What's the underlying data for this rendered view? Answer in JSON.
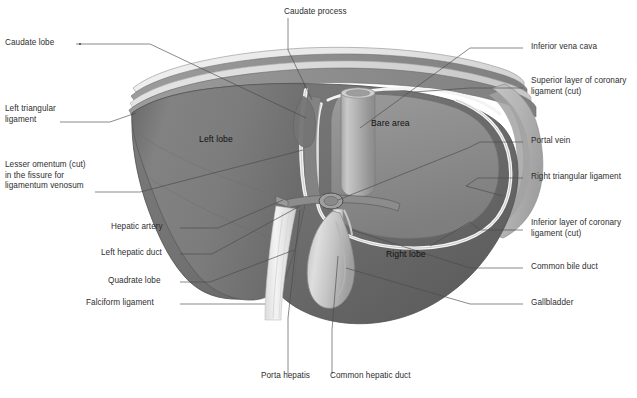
{
  "figure": {
    "background_color": "#ffffff",
    "label_color": "#2e2e2e",
    "leader_color": "#4a4a4a",
    "palette": {
      "liver_left_lobe": "#7d7d7d",
      "liver_right_lobe": "#6f6f6f",
      "bare_area": "#8a8a8a",
      "liver_dark_edge": "#5a5a5a",
      "diaphragm_light": "#d8d8d8",
      "diaphragm_mid": "#b4b4b4",
      "diaphragm_dark": "#8f8f8f",
      "peritoneum_highlight": "#f2f2f2",
      "vessel_gray": "#9a9a9a",
      "gallbladder": "#c9c9c9",
      "falciform": "#e6e6e6"
    }
  },
  "labels_left": [
    {
      "id": "caudate-lobe",
      "text": "Caudate lobe"
    },
    {
      "id": "left-triangular-ligament",
      "text": "Left triangular\nligament"
    },
    {
      "id": "lesser-omentum",
      "text": "Lesser omentum (cut)\nin the fissure for\nligamentum venosum"
    },
    {
      "id": "hepatic-artery",
      "text": "Hepatic artery"
    },
    {
      "id": "left-hepatic-duct",
      "text": "Left hepatic duct"
    },
    {
      "id": "quadrate-lobe",
      "text": "Quadrate lobe"
    },
    {
      "id": "falciform-ligament",
      "text": "Falciform ligament"
    }
  ],
  "labels_right": [
    {
      "id": "inferior-vena-cava",
      "text": "Inferior vena cava"
    },
    {
      "id": "superior-coronary-ligament",
      "text": "Superior layer of coronary\nligament (cut)"
    },
    {
      "id": "portal-vein",
      "text": "Portal vein"
    },
    {
      "id": "right-triangular-ligament",
      "text": "Right triangular ligament"
    },
    {
      "id": "inferior-coronary-ligament",
      "text": "Inferior layer of coronary\nligament (cut)"
    },
    {
      "id": "common-bile-duct",
      "text": "Common bile duct"
    },
    {
      "id": "gallbladder",
      "text": "Gallbladder"
    }
  ],
  "labels_top": [
    {
      "id": "caudate-process",
      "text": "Caudate process"
    }
  ],
  "labels_bottom": [
    {
      "id": "porta-hepatis",
      "text": "Porta hepatis"
    },
    {
      "id": "common-hepatic-duct",
      "text": "Common hepatic duct"
    }
  ],
  "labels_inline": [
    {
      "id": "left-lobe",
      "text": "Left lobe"
    },
    {
      "id": "bare-area",
      "text": "Bare area"
    },
    {
      "id": "right-lobe",
      "text": "Right lobe"
    }
  ]
}
